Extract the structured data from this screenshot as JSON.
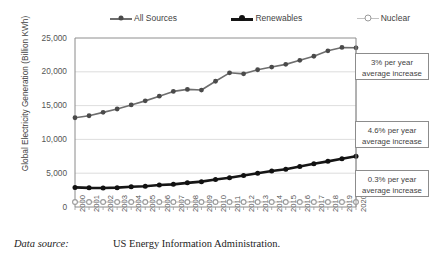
{
  "chart_data": {
    "type": "line",
    "title": "",
    "xlabel": "",
    "ylabel": "Global Electricity Generation (Billion KWh)",
    "ylim": [
      0,
      25000
    ],
    "yticks": [
      0,
      5000,
      10000,
      15000,
      20000,
      25000
    ],
    "ytick_labels": [
      "0",
      "5,000",
      "10,000",
      "15,000",
      "20,000",
      "25,000"
    ],
    "grid": true,
    "legend_position": "top",
    "categories": [
      "2000",
      "2001",
      "2002",
      "2003",
      "2004",
      "2005",
      "2006",
      "2007",
      "2008",
      "2009",
      "2010",
      "2011",
      "2012",
      "2013",
      "2014",
      "2015",
      "2016",
      "2017",
      "2018",
      "2019",
      "2020"
    ],
    "series": [
      {
        "name": "All Sources",
        "color": "#6e6e6e",
        "marker": "filled-circle",
        "values": [
          13200,
          13500,
          14000,
          14500,
          15100,
          15700,
          16400,
          17100,
          17400,
          17300,
          18600,
          19850,
          19700,
          20300,
          20700,
          21100,
          21700,
          22300,
          23100,
          23600,
          23550
        ]
      },
      {
        "name": "Renewables",
        "color": "#161616",
        "marker": "filled-circle",
        "values": [
          2900,
          2830,
          2810,
          2860,
          3000,
          3080,
          3250,
          3350,
          3570,
          3750,
          4080,
          4320,
          4660,
          5000,
          5330,
          5590,
          6000,
          6400,
          6750,
          7150,
          7500
        ]
      },
      {
        "name": "Nuclear",
        "color": "#b5b5b5",
        "marker": "hollow-circle",
        "values": [
          2450,
          2520,
          2550,
          2510,
          2620,
          2630,
          2660,
          2600,
          2600,
          2560,
          2630,
          2520,
          2350,
          2360,
          2410,
          2440,
          2470,
          2500,
          2560,
          2660,
          2550
        ]
      }
    ],
    "nuclear_render_baseline": 200,
    "annotations": [
      {
        "id": "all-sources-growth",
        "line1": "3% per year",
        "line2": "average increase",
        "target_series": "All Sources"
      },
      {
        "id": "renewables-growth",
        "line1": "4.6% per year",
        "line2": "average increase",
        "target_series": "Renewables"
      },
      {
        "id": "nuclear-growth",
        "line1": "0.3% per year",
        "line2": "average increase",
        "target_series": "Nuclear"
      }
    ]
  },
  "legend": {
    "items": [
      {
        "label": "All Sources"
      },
      {
        "label": "Renewables"
      },
      {
        "label": "Nuclear"
      }
    ]
  },
  "caption": {
    "label": "Data source:",
    "text": "US Energy Information Administration."
  }
}
